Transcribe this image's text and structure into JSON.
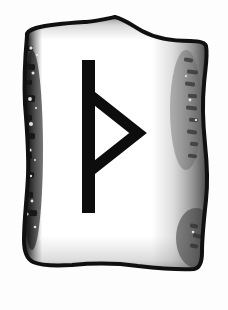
{
  "image": {
    "kind": "rune-stone-illustration",
    "title": "Thurisaz Rune Stone",
    "subject": "Thurisaz",
    "rune_character": "Þ",
    "rune_name": "Thurisaz",
    "rune_transliteration": "th",
    "background_color": "#fdfdfd",
    "width": 228,
    "height": 310
  },
  "stone": {
    "label": "rune stone tablet",
    "fill_color": "#ffffff",
    "outline_color": "#101010",
    "outline_width": 4,
    "left_shadow_color": "#161616",
    "right_shadow_color": "#8a8a8a",
    "shape_note": "irregular shield-like slab with peaked top, dipped shoulders, bulging sides and rounded base"
  },
  "rune": {
    "label": "Thurisaz rune carving",
    "color": "#0d0d0d",
    "stave": {
      "label": "vertical stave",
      "x": 82,
      "y_top": 60,
      "y_bottom": 213,
      "width": 13
    },
    "triangle": {
      "label": "right-pointing triangle branch",
      "top_x": 90,
      "top_y": 95,
      "apex_x": 138,
      "apex_y": 133,
      "bottom_x": 90,
      "bottom_y": 171,
      "stroke_width": 11
    }
  },
  "texture": {
    "left_band_label": "dark mottled edge texture",
    "right_band_label": "soft gray gradient shading",
    "speckle_color": "#f4f4f4",
    "speckles": [
      {
        "cx": 31,
        "cy": 48,
        "r": 1.7
      },
      {
        "cx": 26,
        "cy": 60,
        "r": 1.3
      },
      {
        "cx": 33,
        "cy": 73,
        "r": 1.5
      },
      {
        "cx": 25,
        "cy": 86,
        "r": 1.2
      },
      {
        "cx": 30,
        "cy": 99,
        "r": 1.9
      },
      {
        "cx": 23,
        "cy": 112,
        "r": 1.4
      },
      {
        "cx": 31,
        "cy": 124,
        "r": 2.0
      },
      {
        "cx": 24,
        "cy": 137,
        "r": 1.3
      },
      {
        "cx": 30,
        "cy": 150,
        "r": 1.6
      },
      {
        "cx": 23,
        "cy": 163,
        "r": 1.5
      },
      {
        "cx": 31,
        "cy": 176,
        "r": 1.2
      },
      {
        "cx": 25,
        "cy": 189,
        "r": 1.8
      },
      {
        "cx": 32,
        "cy": 201,
        "r": 1.4
      },
      {
        "cx": 27,
        "cy": 214,
        "r": 1.6
      },
      {
        "cx": 35,
        "cy": 227,
        "r": 1.3
      },
      {
        "cx": 41,
        "cy": 238,
        "r": 1.5
      },
      {
        "cx": 37,
        "cy": 55,
        "r": 1.1
      },
      {
        "cx": 36,
        "cy": 108,
        "r": 1.1
      },
      {
        "cx": 35,
        "cy": 160,
        "r": 1.0
      },
      {
        "cx": 190,
        "cy": 100,
        "r": 1.4
      },
      {
        "cx": 196,
        "cy": 120,
        "r": 1.2
      },
      {
        "cx": 186,
        "cy": 76,
        "r": 1.1
      },
      {
        "cx": 193,
        "cy": 232,
        "r": 1.3
      }
    ],
    "left_streaks": [
      {
        "x": 24,
        "y": 46,
        "w": 9,
        "h": 5,
        "rot": -6
      },
      {
        "x": 27,
        "y": 64,
        "w": 8,
        "h": 6,
        "rot": 4
      },
      {
        "x": 22,
        "y": 80,
        "w": 10,
        "h": 5,
        "rot": -3
      },
      {
        "x": 26,
        "y": 95,
        "w": 9,
        "h": 7,
        "rot": 5
      },
      {
        "x": 21,
        "y": 115,
        "w": 11,
        "h": 6,
        "rot": -4
      },
      {
        "x": 26,
        "y": 133,
        "w": 9,
        "h": 6,
        "rot": 3
      },
      {
        "x": 22,
        "y": 152,
        "w": 10,
        "h": 7,
        "rot": -5
      },
      {
        "x": 25,
        "y": 172,
        "w": 9,
        "h": 6,
        "rot": 4
      },
      {
        "x": 23,
        "y": 192,
        "w": 10,
        "h": 6,
        "rot": -3
      },
      {
        "x": 28,
        "y": 210,
        "w": 9,
        "h": 6,
        "rot": 6
      }
    ],
    "right_streaks": [
      {
        "x": 184,
        "y": 58,
        "w": 9,
        "h": 4,
        "rot": 8
      },
      {
        "x": 187,
        "y": 70,
        "w": 11,
        "h": 4,
        "rot": 6
      },
      {
        "x": 185,
        "y": 82,
        "w": 10,
        "h": 4,
        "rot": 9
      },
      {
        "x": 188,
        "y": 94,
        "w": 9,
        "h": 4,
        "rot": 5
      },
      {
        "x": 186,
        "y": 106,
        "w": 11,
        "h": 4,
        "rot": 8
      },
      {
        "x": 189,
        "y": 118,
        "w": 9,
        "h": 4,
        "rot": 6
      },
      {
        "x": 187,
        "y": 130,
        "w": 10,
        "h": 4,
        "rot": 9
      },
      {
        "x": 190,
        "y": 142,
        "w": 8,
        "h": 4,
        "rot": 5
      },
      {
        "x": 188,
        "y": 154,
        "w": 9,
        "h": 4,
        "rot": 7
      },
      {
        "x": 190,
        "y": 224,
        "w": 8,
        "h": 4,
        "rot": 12
      },
      {
        "x": 193,
        "y": 234,
        "w": 9,
        "h": 4,
        "rot": 14
      },
      {
        "x": 190,
        "y": 244,
        "w": 8,
        "h": 4,
        "rot": 10
      }
    ]
  }
}
